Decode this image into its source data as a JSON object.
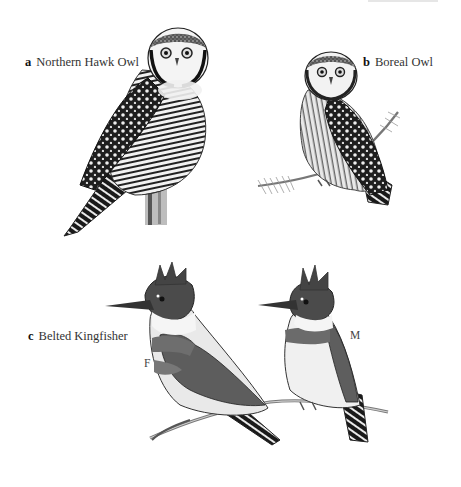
{
  "plate": {
    "background": "#ffffff",
    "species": [
      {
        "letter": "a",
        "name": "Northern Hawk Owl"
      },
      {
        "letter": "b",
        "name": "Boreal Owl"
      },
      {
        "letter": "c",
        "name": "Belted Kingfisher"
      }
    ],
    "sex_labels": {
      "female": "F",
      "male": "M"
    }
  }
}
